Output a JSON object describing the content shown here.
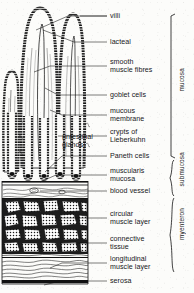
{
  "figure": {
    "ink_color": "#111111",
    "paper_color": "#fcfcfa"
  },
  "labels": [
    {
      "id": "villi",
      "text": "villi",
      "x": 110,
      "y": 12,
      "leader_from_x": 88,
      "leader_from_y": 16
    },
    {
      "id": "lacteal",
      "text": "lacteal",
      "x": 110,
      "y": 38,
      "leader_from_x": 88,
      "leader_from_y": 42
    },
    {
      "id": "smooth-muscle-fibres",
      "text": "smooth\nmuscle fibres",
      "x": 110,
      "y": 58,
      "leader_from_x": 88,
      "leader_from_y": 62
    },
    {
      "id": "goblet-cells",
      "text": "goblet cells",
      "x": 110,
      "y": 91,
      "leader_from_x": 88,
      "leader_from_y": 95
    },
    {
      "id": "mucous-membrane",
      "text": "mucous\nmembrane",
      "x": 110,
      "y": 107,
      "leader_from_x": 88,
      "leader_from_y": 111
    },
    {
      "id": "crypts-of-lieberkuhn",
      "text": "crypts of\nLieberkuhn",
      "x": 110,
      "y": 128,
      "leader_from_x": 88,
      "leader_from_y": 132
    },
    {
      "id": "intestinal-glands",
      "text": "(intestinal\nglands)",
      "x": 62,
      "y": 135,
      "leader_from_x": null,
      "leader_from_y": null
    },
    {
      "id": "paneth-cells",
      "text": "Paneth cells",
      "x": 110,
      "y": 152,
      "leader_from_x": 88,
      "leader_from_y": 156
    },
    {
      "id": "muscularis-mucosa",
      "text": "muscularis\nmucosa",
      "x": 110,
      "y": 167,
      "leader_from_x": 88,
      "leader_from_y": 171
    },
    {
      "id": "blood-vessel",
      "text": "blood vessel",
      "x": 110,
      "y": 187,
      "leader_from_x": 88,
      "leader_from_y": 191
    },
    {
      "id": "circular-muscle-layer",
      "text": "circular\nmuscle layer",
      "x": 110,
      "y": 210,
      "leader_from_x": 88,
      "leader_from_y": 214
    },
    {
      "id": "connective-tissue",
      "text": "connective\ntissue",
      "x": 110,
      "y": 235,
      "leader_from_x": 88,
      "leader_from_y": 239
    },
    {
      "id": "longitudinal-muscle",
      "text": "longitudinal\nmuscle layer",
      "x": 110,
      "y": 255,
      "leader_from_x": 88,
      "leader_from_y": 259
    },
    {
      "id": "serosa",
      "text": "serosa",
      "x": 110,
      "y": 277,
      "leader_from_x": 88,
      "leader_from_y": 281
    }
  ],
  "brackets": [
    {
      "id": "mucosa",
      "text": "mucosa",
      "top": 14,
      "bottom": 158,
      "style": "square",
      "label_y": 86,
      "label_x": 180
    },
    {
      "id": "submucosa",
      "text": "submucosa",
      "top": 160,
      "bottom": 196,
      "style": "brace",
      "label_y": 178,
      "label_x": 180
    },
    {
      "id": "myenteron",
      "text": "myenteron",
      "top": 198,
      "bottom": 272,
      "style": "brace",
      "label_y": 235,
      "label_x": 180
    }
  ]
}
